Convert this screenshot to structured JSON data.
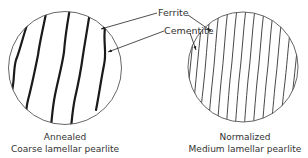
{
  "labels": {
    "ferrite": "Ferrite",
    "cementite": "Cementite"
  },
  "left_panel": {
    "caption_line1": "Annealed",
    "caption_line2": "Coarse lamellar pearlite",
    "lamellae": "coarse"
  },
  "right_panel": {
    "caption_line1": "Normalized",
    "caption_line2": "Medium lamellar pearlite",
    "lamellae": "medium"
  },
  "colors": {
    "ink": "#222222",
    "text": "#333333",
    "background": "#ffffff"
  }
}
